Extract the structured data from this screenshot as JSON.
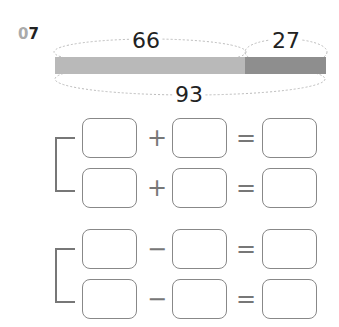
{
  "question": {
    "number_prefix": "0",
    "number_suffix": "7"
  },
  "tape_diagram": {
    "part1": "66",
    "part2": "27",
    "total": "93",
    "colors": {
      "part1": "#b9b9b9",
      "part2": "#8e8e8e"
    }
  },
  "addition_rows": [
    {
      "op": "+",
      "eq": "="
    },
    {
      "op": "+",
      "eq": "="
    }
  ],
  "subtraction_rows": [
    {
      "op": "−",
      "eq": "="
    },
    {
      "op": "−",
      "eq": "="
    }
  ]
}
